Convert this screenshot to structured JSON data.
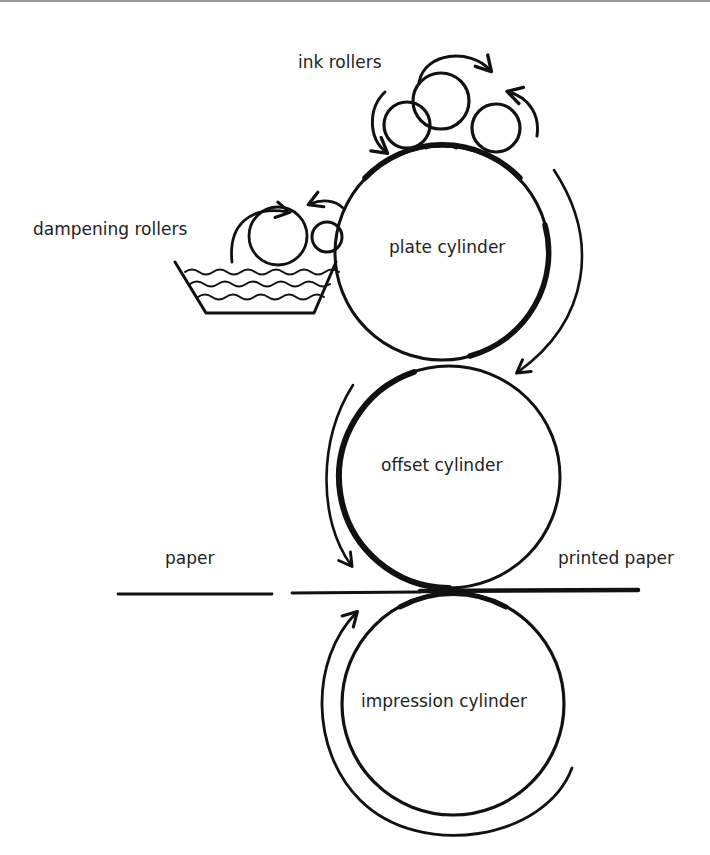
{
  "diagram": {
    "type": "offset lithography press schematic",
    "colors": {
      "ink": "#111111",
      "text": "#222222",
      "background": "#ffffff"
    },
    "labels": {
      "ink_rollers": "ink rollers",
      "dampening_rollers": "dampening rollers",
      "plate_cylinder": "plate cylinder",
      "offset_cylinder": "offset cylinder",
      "paper": "paper",
      "printed_paper": "printed paper",
      "impression_cylinder": "impression cylinder"
    },
    "components": [
      {
        "id": "ink-rollers",
        "label": "ink rollers",
        "count": 3
      },
      {
        "id": "dampening-rollers",
        "label": "dampening rollers",
        "count": 2,
        "in_water_tray": true
      },
      {
        "id": "plate-cylinder",
        "label": "plate cylinder"
      },
      {
        "id": "offset-cylinder",
        "label": "offset cylinder"
      },
      {
        "id": "impression-cylinder",
        "label": "impression cylinder"
      }
    ],
    "flows": [
      {
        "from": "paper",
        "to": "printed paper",
        "via": "offset / impression nip"
      }
    ],
    "rotation_arrows": [
      {
        "around": "top ink roller",
        "direction": "clockwise"
      },
      {
        "around": "left ink roller",
        "direction": "counter-clockwise"
      },
      {
        "around": "right ink roller",
        "direction": "counter-clockwise"
      },
      {
        "around": "large dampening roller",
        "direction": "clockwise"
      },
      {
        "around": "small dampening roller",
        "direction": "counter-clockwise"
      },
      {
        "around": "plate cylinder",
        "direction": "clockwise"
      },
      {
        "around": "offset cylinder",
        "direction": "counter-clockwise"
      },
      {
        "around": "impression cylinder",
        "direction": "clockwise"
      }
    ]
  }
}
